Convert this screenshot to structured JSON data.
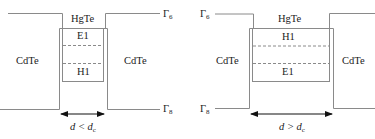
{
  "left_panel": {
    "barrier_left_label": "CdTe",
    "well_label": "HgTe",
    "upper_level_label": "E1",
    "lower_level_label": "H1",
    "barrier_right_label": "CdTe",
    "gamma6_label": "Γ",
    "gamma6_sub": "6",
    "gamma8_label": "Γ",
    "gamma8_sub": "8",
    "width_condition": "d < d",
    "width_condition_sub": "c"
  },
  "right_panel": {
    "barrier_left_label": "CdTe",
    "well_label": "HgTe",
    "upper_level_label": "H1",
    "lower_level_label": "E1",
    "barrier_right_label": "CdTe",
    "gamma6_label": "Γ",
    "gamma6_sub": "6",
    "gamma8_label": "Γ",
    "gamma8_sub": "8",
    "width_condition": "d > d",
    "width_condition_sub": "c"
  },
  "colors": {
    "line": "#8a8a8a",
    "dashed": "#8a8a8a",
    "arrow": "#111111",
    "text": "#222222"
  }
}
